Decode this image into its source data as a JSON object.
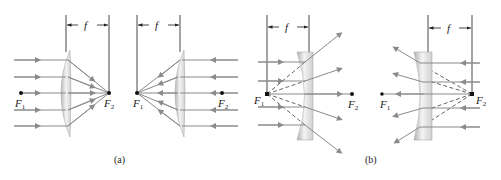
{
  "figure": {
    "panels": [
      {
        "id": "a-left",
        "lens": "converging",
        "focal_label": "f",
        "focus_1": "F",
        "focus_1_sub": "1",
        "focus_2": "F",
        "focus_2_sub": "2",
        "direction": "left-to-right"
      },
      {
        "id": "a-right",
        "lens": "converging",
        "focal_label": "f",
        "focus_1": "F",
        "focus_1_sub": "1",
        "focus_2": "F",
        "focus_2_sub": "2",
        "direction": "right-to-left"
      },
      {
        "id": "b-left",
        "lens": "diverging",
        "focal_label": "f",
        "focus_1": "F",
        "focus_1_sub": "1",
        "focus_2": "F",
        "focus_2_sub": "2",
        "direction": "left-to-right"
      },
      {
        "id": "b-right",
        "lens": "diverging",
        "focal_label": "f",
        "focus_1": "F",
        "focus_1_sub": "1",
        "focus_2": "F",
        "focus_2_sub": "2",
        "direction": "right-to-left"
      }
    ],
    "captions": {
      "a": "(a)",
      "b": "(b)"
    },
    "colors": {
      "ray": "#8a8a8a",
      "lens_light": "#f2f2f2",
      "lens_dark": "#b5b5b5",
      "ink": "#222222"
    }
  }
}
